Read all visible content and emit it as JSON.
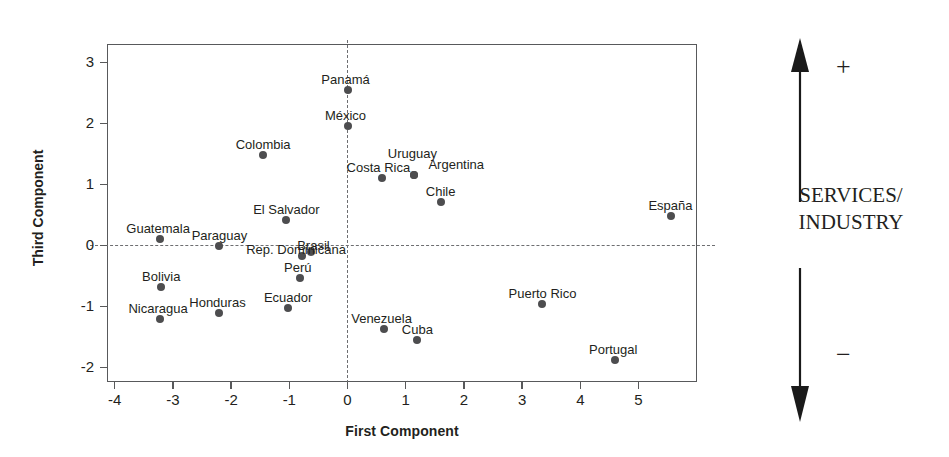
{
  "chart_data": {
    "type": "scatter",
    "title": "",
    "xlabel": "First Component",
    "ylabel": "Third Component",
    "xlim": [
      -4.2,
      5.9
    ],
    "ylim": [
      -2.15,
      3.0
    ],
    "xticks": [
      -4,
      -3,
      -2,
      -1,
      0,
      1,
      2,
      3,
      4,
      5
    ],
    "xticklabels": [
      "-4",
      "-3",
      "-2",
      "-1",
      "0",
      "1",
      "2",
      "3",
      "4",
      "5"
    ],
    "yticks": [
      -2,
      -1,
      0,
      1,
      2,
      3
    ],
    "yticklabels": [
      "-2",
      "-1",
      "0",
      "1",
      "2",
      "3"
    ],
    "grid": false,
    "legend": null,
    "reference_lines": [
      {
        "axis": "y",
        "value": 0,
        "style": "dashed"
      },
      {
        "axis": "x",
        "value": 0,
        "style": "dashed"
      }
    ],
    "points": [
      {
        "label": "Panamá",
        "x": 0.0,
        "y": 2.55,
        "label_dx": -2,
        "label_dy": -17,
        "label_align": "center"
      },
      {
        "label": "México",
        "x": 0.0,
        "y": 1.96,
        "label_dx": -2,
        "label_dy": -17,
        "label_align": "center"
      },
      {
        "label": "Colombia",
        "x": -1.45,
        "y": 1.49,
        "label_dx": 0,
        "label_dy": -17,
        "label_align": "center"
      },
      {
        "label": "Uruguay",
        "x": 1.15,
        "y": 1.15,
        "label_dx": -2,
        "label_dy": -28,
        "label_align": "center"
      },
      {
        "label": "Argentina",
        "x": 1.15,
        "y": 1.15,
        "label_dx": 14,
        "label_dy": -17,
        "label_align": "left"
      },
      {
        "label": "Costa Rica",
        "x": 0.6,
        "y": 1.1,
        "label_dx": -4,
        "label_dy": -17,
        "label_align": "center"
      },
      {
        "label": "Chile",
        "x": 1.6,
        "y": 0.72,
        "label_dx": 0,
        "label_dy": -17,
        "label_align": "center"
      },
      {
        "label": "España",
        "x": 5.55,
        "y": 0.48,
        "label_dx": 0,
        "label_dy": -17,
        "label_align": "center"
      },
      {
        "label": "El Salvador",
        "x": -1.05,
        "y": 0.41,
        "label_dx": 0,
        "label_dy": -17,
        "label_align": "center"
      },
      {
        "label": "Guatemala",
        "x": -3.22,
        "y": 0.11,
        "label_dx": -2,
        "label_dy": -17,
        "label_align": "center"
      },
      {
        "label": "Paraguay",
        "x": -2.2,
        "y": 0.0,
        "label_dx": 0,
        "label_dy": -17,
        "label_align": "center"
      },
      {
        "label": "Brasil",
        "x": -0.62,
        "y": -0.11,
        "label_dx": 2,
        "label_dy": -13,
        "label_align": "center"
      },
      {
        "label": "Rep. Dominicana",
        "x": -0.78,
        "y": -0.17,
        "label_dx": -6,
        "label_dy": -13,
        "label_align": "center"
      },
      {
        "label": "Perú",
        "x": -0.82,
        "y": -0.53,
        "label_dx": -2,
        "label_dy": -17,
        "label_align": "center"
      },
      {
        "label": "Bolivia",
        "x": -3.2,
        "y": -0.68,
        "label_dx": 0,
        "label_dy": -17,
        "label_align": "center"
      },
      {
        "label": "Puerto Rico",
        "x": 3.35,
        "y": -0.96,
        "label_dx": 0,
        "label_dy": -17,
        "label_align": "center"
      },
      {
        "label": "Ecuador",
        "x": -1.02,
        "y": -1.02,
        "label_dx": 0,
        "label_dy": -17,
        "label_align": "center"
      },
      {
        "label": "Honduras",
        "x": -2.2,
        "y": -1.1,
        "label_dx": -2,
        "label_dy": -17,
        "label_align": "center"
      },
      {
        "label": "Nicaragua",
        "x": -3.22,
        "y": -1.2,
        "label_dx": -2,
        "label_dy": -17,
        "label_align": "center"
      },
      {
        "label": "Venezuela",
        "x": 0.62,
        "y": -1.37,
        "label_dx": -2,
        "label_dy": -17,
        "label_align": "center"
      },
      {
        "label": "Cuba",
        "x": 1.2,
        "y": -1.55,
        "label_dx": 0,
        "label_dy": -17,
        "label_align": "center"
      },
      {
        "label": "Portugal",
        "x": 4.6,
        "y": -1.87,
        "label_dx": -2,
        "label_dy": -17,
        "label_align": "center"
      }
    ],
    "colors": {
      "point": "#4d4d4f",
      "axis": "#58595b",
      "reference_line": "#6d6e71",
      "text": "#231f20",
      "background": "#ffffff"
    }
  },
  "annotation": {
    "plus_label": "+",
    "minus_label": "−",
    "text_line1": "SERVICES/",
    "text_line2": "INDUSTRY",
    "arrow_name": "double-headed-vertical-arrow"
  },
  "bleed_through": {
    "line1": "",
    "line2": "",
    "line3": ""
  }
}
